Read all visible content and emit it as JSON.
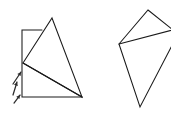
{
  "canvas": {
    "width": 171,
    "height": 116,
    "background_color": "#ffffff",
    "stroke_color": "#1a1a1a",
    "stroke_width": 1.05,
    "description": "Hand-drawn line diagram of two overlapping polygon figures on a plain white background"
  },
  "figures": [
    {
      "id": "left-figure",
      "name": "rectangle-with-overlaid-triangle",
      "label": "Left figure: rectangle with an overlaid tall triangle and an internal diagonal",
      "parts": [
        {
          "id": "rectangle-outline",
          "name": "rectangle",
          "type": "polyline",
          "closed": false,
          "points": [
            [
              42,
              30
            ],
            [
              22,
              30
            ],
            [
              22,
              97
            ],
            [
              82,
              97
            ]
          ]
        },
        {
          "id": "triangle-outline",
          "name": "triangle",
          "type": "polygon",
          "closed": true,
          "points": [
            [
              52,
              18
            ],
            [
              82,
              97
            ],
            [
              23,
              63
            ]
          ]
        },
        {
          "id": "internal-diagonal",
          "name": "diagonal-line",
          "type": "line",
          "points": [
            [
              23,
              63
            ],
            [
              82,
              97
            ]
          ]
        }
      ]
    },
    {
      "id": "right-figure",
      "name": "kite-quadrilateral",
      "label": "Right figure: kite-shaped quadrilateral, partially clipped at the right image edge, with an internal chord",
      "parts": [
        {
          "id": "kite-outline",
          "name": "kite",
          "type": "polygon",
          "closed": true,
          "points": [
            [
              148,
              10
            ],
            [
              178,
              34
            ],
            [
              140,
              107
            ],
            [
              119,
              44
            ]
          ]
        },
        {
          "id": "kite-chord",
          "name": "chord-line",
          "type": "line",
          "points": [
            [
              119,
              44
            ],
            [
              180,
              28
            ]
          ]
        }
      ]
    }
  ],
  "annotations": {
    "arrow_group": {
      "id": "arrow-marks",
      "name": "direction-arrows",
      "label": "Three small arrow marks pointing up and to the right, at the lower-left of the left figure",
      "count": 3,
      "color": "#2b2b2b",
      "arrows": [
        {
          "id": "arrow-1",
          "from": [
            13,
            84
          ],
          "to": [
            21,
            72
          ]
        },
        {
          "id": "arrow-2",
          "from": [
            13,
            95
          ],
          "to": [
            17,
            82
          ]
        },
        {
          "id": "arrow-3",
          "from": [
            14,
            103
          ],
          "to": [
            20,
            95
          ]
        }
      ]
    }
  }
}
